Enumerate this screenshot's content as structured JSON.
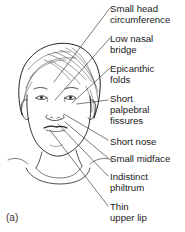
{
  "figure": {
    "panel_label": "(a)",
    "labels": [
      {
        "text": "Small head\ncircumference",
        "top": 3
      },
      {
        "text": "Low nasal\nbridge",
        "top": 33
      },
      {
        "text": "Epicanthic\nfolds",
        "top": 63
      },
      {
        "text": "Short\npalpebral\nfissures",
        "top": 93
      },
      {
        "text": "Short nose",
        "top": 137
      },
      {
        "text": "Small midface",
        "top": 155
      },
      {
        "text": "Indistinct\nphiltrum",
        "top": 173
      },
      {
        "text": "Thin\nupper lip",
        "top": 203
      }
    ],
    "line_color": "#222222"
  }
}
